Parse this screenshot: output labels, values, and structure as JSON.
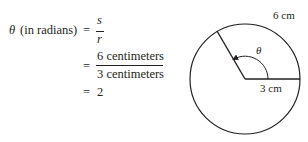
{
  "equation": {
    "lhs_symbol": "θ",
    "lhs_label": "(in radians)",
    "eq1": "=",
    "frac1": {
      "numerator": "s",
      "denominator": "r"
    },
    "eq2": "=",
    "frac2": {
      "numerator": "6 centimeters",
      "denominator": "3 centimeters"
    },
    "eq3": "=",
    "result": "2"
  },
  "diagram": {
    "arc_label": "6 cm",
    "radius_label": "3 cm",
    "angle_label": "θ",
    "stroke_color": "#231f20"
  }
}
